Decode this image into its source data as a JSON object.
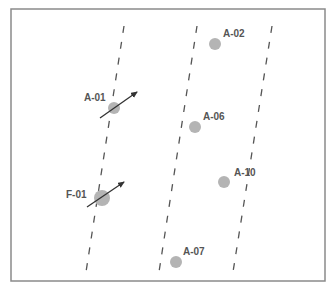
{
  "diagram": {
    "frame": {
      "x": 11,
      "y": 9,
      "width": 314,
      "height": 272,
      "stroke": "#8a8a8a"
    },
    "lane_lines": [
      {
        "id": "lane-1",
        "x1": 124,
        "y1": 26,
        "x2": 86,
        "y2": 272
      },
      {
        "id": "lane-2",
        "x1": 197,
        "y1": 26,
        "x2": 159,
        "y2": 272
      },
      {
        "id": "lane-3",
        "x1": 272,
        "y1": 26,
        "x2": 233,
        "y2": 272
      }
    ],
    "markers": [
      {
        "label": "A-02",
        "cx": 215,
        "cy": 44,
        "r": 6,
        "label_x": 223,
        "label_y": 37,
        "arrow": null
      },
      {
        "label": "A-01",
        "cx": 114,
        "cy": 108,
        "r": 6,
        "label_x": 84,
        "label_y": 101,
        "arrow": {
          "x1": 100,
          "y1": 118,
          "x2": 137,
          "y2": 92
        }
      },
      {
        "label": "A-06",
        "cx": 195,
        "cy": 127,
        "r": 6,
        "label_x": 203,
        "label_y": 120,
        "arrow": null
      },
      {
        "label": "A-10",
        "cx": 224,
        "cy": 182,
        "r": 6,
        "label_x": 234,
        "label_y": 176,
        "arrow": null
      },
      {
        "label": "F-01",
        "cx": 102,
        "cy": 198,
        "r": 8,
        "label_x": 66,
        "label_y": 198,
        "arrow": {
          "x1": 87,
          "y1": 207,
          "x2": 124,
          "y2": 182
        }
      },
      {
        "label": "A-07",
        "cx": 176,
        "cy": 262,
        "r": 6,
        "label_x": 183,
        "label_y": 255,
        "arrow": null
      }
    ],
    "colors": {
      "marker_fill": "#b4b4b4",
      "label_text": "#555555",
      "dash_stroke": "#555555",
      "arrow_stroke": "#333333"
    }
  }
}
